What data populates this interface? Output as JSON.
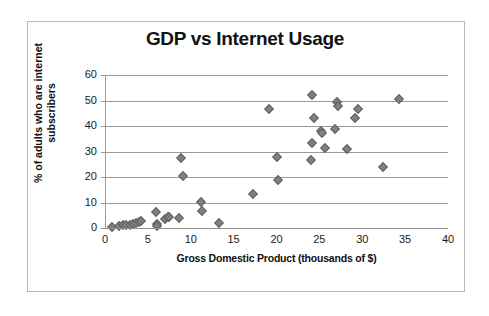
{
  "chart_data": {
    "type": "scatter",
    "title": "GDP vs Internet Usage",
    "xlabel": "Gross Domestic Product (thousands of $)",
    "ylabel": "% of adults who are internet subscribers",
    "ylabel_line1": "% of adults who are internet",
    "ylabel_line2": "subscribers",
    "xlim": [
      0,
      40
    ],
    "ylim": [
      0,
      60
    ],
    "xticks": [
      0,
      5,
      10,
      15,
      20,
      25,
      30,
      35,
      40
    ],
    "yticks": [
      0,
      10,
      20,
      30,
      40,
      50,
      60
    ],
    "grid": "horizontal",
    "legend": "none",
    "marker": "diamond",
    "marker_color": "#808080",
    "points": [
      {
        "x": 0.7,
        "y": 0.5
      },
      {
        "x": 1.5,
        "y": 0.8
      },
      {
        "x": 2.0,
        "y": 1.2
      },
      {
        "x": 2.3,
        "y": 1.1
      },
      {
        "x": 2.8,
        "y": 1.3
      },
      {
        "x": 3.2,
        "y": 1.5
      },
      {
        "x": 3.5,
        "y": 2.0
      },
      {
        "x": 3.9,
        "y": 2.4
      },
      {
        "x": 4.1,
        "y": 2.6
      },
      {
        "x": 5.8,
        "y": 6.3
      },
      {
        "x": 5.9,
        "y": 1.5
      },
      {
        "x": 6.0,
        "y": 0.9
      },
      {
        "x": 6.9,
        "y": 3.6
      },
      {
        "x": 7.2,
        "y": 4.4
      },
      {
        "x": 7.4,
        "y": 4.2
      },
      {
        "x": 8.5,
        "y": 4.0
      },
      {
        "x": 8.7,
        "y": 27.5
      },
      {
        "x": 9.0,
        "y": 20.4
      },
      {
        "x": 11.1,
        "y": 10.2
      },
      {
        "x": 11.2,
        "y": 6.8
      },
      {
        "x": 13.2,
        "y": 1.8
      },
      {
        "x": 17.2,
        "y": 13.4
      },
      {
        "x": 19.0,
        "y": 46.5
      },
      {
        "x": 19.9,
        "y": 28.0
      },
      {
        "x": 20.1,
        "y": 18.8
      },
      {
        "x": 23.9,
        "y": 26.7
      },
      {
        "x": 24.0,
        "y": 52.0
      },
      {
        "x": 24.0,
        "y": 33.2
      },
      {
        "x": 24.3,
        "y": 43.2
      },
      {
        "x": 25.1,
        "y": 38.2
      },
      {
        "x": 25.2,
        "y": 37.4
      },
      {
        "x": 25.5,
        "y": 31.3
      },
      {
        "x": 26.7,
        "y": 39.0
      },
      {
        "x": 26.9,
        "y": 49.6
      },
      {
        "x": 27.0,
        "y": 47.7
      },
      {
        "x": 28.1,
        "y": 31.0
      },
      {
        "x": 29.0,
        "y": 43.2
      },
      {
        "x": 29.4,
        "y": 46.8
      },
      {
        "x": 32.3,
        "y": 23.8
      },
      {
        "x": 34.2,
        "y": 50.6
      }
    ]
  },
  "axes": {
    "x_tick_labels": [
      "0",
      "5",
      "10",
      "15",
      "20",
      "25",
      "30",
      "35",
      "40"
    ],
    "y_tick_labels": [
      "0",
      "10",
      "20",
      "30",
      "40",
      "50",
      "60"
    ]
  }
}
